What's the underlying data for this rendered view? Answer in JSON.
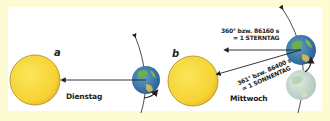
{
  "diagram": {
    "colors": {
      "frame": "#fcfbd2",
      "panel": "#ffffff",
      "sun": "#f7d93a",
      "sun_edge": "#b9931e",
      "earth_ocean": "#3b7fb8",
      "earth_land": "#6fae4a",
      "earth_faded": "#c9ddd0",
      "arrow": "#222222"
    },
    "panels": [
      {
        "letter": "a",
        "day_label": "Dienstag",
        "sun": {
          "cx": 35,
          "cy": 80,
          "r": 25
        },
        "earth": {
          "cx": 146,
          "cy": 80,
          "r": 14
        }
      },
      {
        "letter": "b",
        "day_label": "Mittwoch",
        "sun": {
          "cx": 193,
          "cy": 81,
          "r": 25
        },
        "earth_current": {
          "cx": 301,
          "cy": 50,
          "r": 15
        },
        "earth_previous": {
          "cx": 301,
          "cy": 85,
          "r": 15
        },
        "annotations": [
          {
            "line1": "360° bzw. 86160 s",
            "line2": "= 1 STERNTAG"
          },
          {
            "line1": "361° bzw. 86400 s",
            "line2": "= 1 SONNENTAG"
          }
        ]
      }
    ]
  }
}
